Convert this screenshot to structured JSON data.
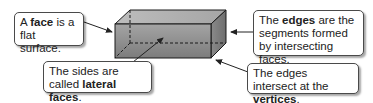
{
  "diagram": {
    "callouts": [
      {
        "id": "face",
        "parts": [
          "A ",
          "face",
          " is a flat surface."
        ],
        "bold": "face"
      },
      {
        "id": "edges",
        "parts": [
          "The ",
          "edges",
          " are the segments formed by intersecting faces."
        ],
        "bold": "edges"
      },
      {
        "id": "lateral",
        "parts": [
          "The sides are called ",
          "lateral faces",
          "."
        ],
        "bold": "lateral faces"
      },
      {
        "id": "vertices",
        "parts": [
          "The edges intersect at the ",
          "vertices",
          "."
        ],
        "bold": "vertices"
      }
    ],
    "colors": {
      "prism_front_top": "#9a9a9a",
      "prism_front_bottom": "#7a7a7a",
      "prism_top": "#b8b8b8",
      "prism_side": "#8c8c8c",
      "outline": "#1a1a1a"
    }
  }
}
